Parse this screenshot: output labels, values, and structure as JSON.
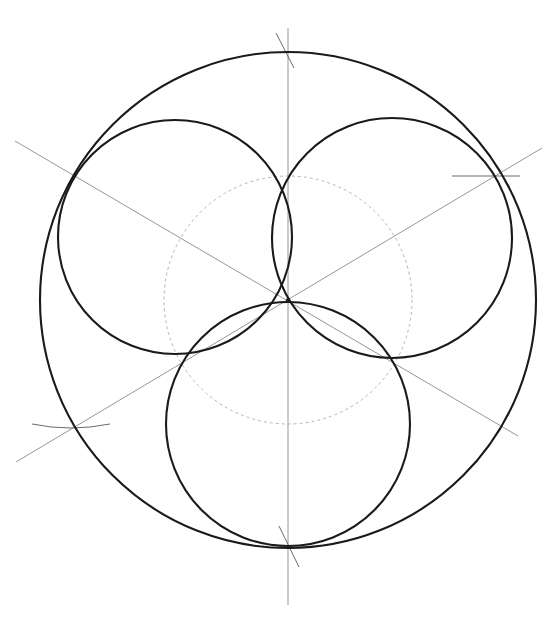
{
  "drawing": {
    "title": "",
    "type": "geometric construction",
    "description": "Three equal circles inscribed in a circle, meeting at the center, with construction lines",
    "colors": {
      "background": "#ffffff",
      "ink": "#1a1a1a",
      "guide": "#8a8a8a",
      "guide_faint": "#b5b5b5"
    },
    "outer_circle": {
      "cx": 288,
      "cy": 300,
      "r": 248
    },
    "inner_circles": [
      {
        "name": "top-left",
        "cx": 175,
        "cy": 237,
        "r": 117
      },
      {
        "name": "top-right",
        "cx": 392,
        "cy": 238,
        "r": 120
      },
      {
        "name": "bottom",
        "cx": 288,
        "cy": 424,
        "r": 122
      }
    ],
    "guide_circle": {
      "cx": 288,
      "cy": 300,
      "r": 124
    },
    "axis_lines": [
      {
        "name": "vertical-axis",
        "x1": 288,
        "y1": 28,
        "x2": 288,
        "y2": 605
      },
      {
        "name": "diagonal-descending",
        "x1": 15,
        "y1": 141,
        "x2": 518,
        "y2": 436
      },
      {
        "name": "diagonal-ascending",
        "x1": 16,
        "y1": 462,
        "x2": 542,
        "y2": 148
      }
    ],
    "tick_marks": [
      {
        "name": "top-arc-tick",
        "x1": 276,
        "y1": 33,
        "x2": 294,
        "y2": 68
      },
      {
        "name": "bottom-arc-tick",
        "x1": 279,
        "y1": 526,
        "x2": 299,
        "y2": 567
      },
      {
        "name": "left-arc-tick",
        "x1": 32,
        "y1": 424,
        "x2": 110,
        "y2": 426
      },
      {
        "name": "right-arc-tick",
        "x1": 452,
        "y1": 174,
        "x2": 520,
        "y2": 176
      }
    ]
  }
}
